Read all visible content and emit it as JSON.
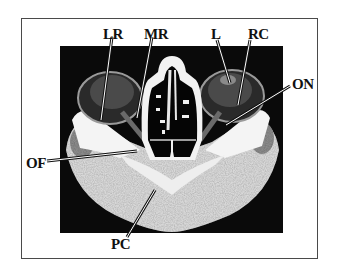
{
  "figure": {
    "type": "axial CT scan of orbits",
    "labels": [
      {
        "id": "LR",
        "text": "LR",
        "x": 103,
        "y": 27
      },
      {
        "id": "MR",
        "text": "MR",
        "x": 144,
        "y": 27
      },
      {
        "id": "L",
        "text": "L",
        "x": 211,
        "y": 27
      },
      {
        "id": "RC",
        "text": "RC",
        "x": 248,
        "y": 27
      },
      {
        "id": "ON",
        "text": "ON",
        "x": 292,
        "y": 77
      },
      {
        "id": "OF",
        "text": "OF",
        "x": 26,
        "y": 156
      },
      {
        "id": "PC",
        "text": "PC",
        "x": 111,
        "y": 237
      }
    ]
  }
}
